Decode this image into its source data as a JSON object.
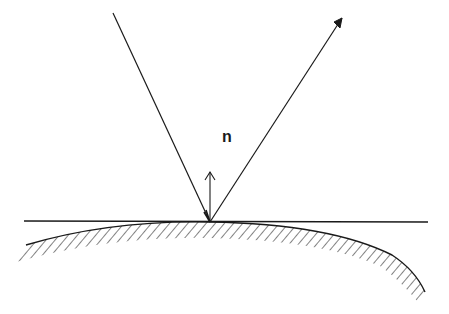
{
  "diagram": {
    "labels": {
      "normal": "n"
    },
    "colors": {
      "stroke": "#1a1a1a",
      "background": "#ffffff"
    },
    "elements": [
      {
        "id": "incident-ray",
        "from": [
          113,
          13
        ],
        "to": [
          210,
          222
        ],
        "arrow": false
      },
      {
        "id": "reflected-ray",
        "from": [
          210,
          222
        ],
        "to": [
          342,
          18
        ],
        "arrow": true
      },
      {
        "id": "normal-vector",
        "from": [
          210,
          222
        ],
        "to": [
          210,
          172
        ],
        "arrow": true,
        "label": "n"
      },
      {
        "id": "tangent-plane",
        "from": [
          24,
          221
        ],
        "to": [
          428,
          222
        ]
      },
      {
        "id": "curved-surface",
        "type": "hatched-curve"
      }
    ]
  }
}
